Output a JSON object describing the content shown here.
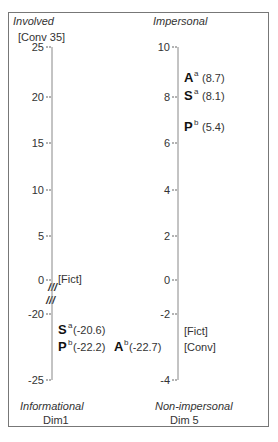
{
  "chart_data": [
    {
      "type": "scatter",
      "name": "Dim1",
      "title": "Dim1",
      "top_label": "Involved",
      "bottom_label": "Informational",
      "top_annotation": "[Conv 35]",
      "axis_break_marks": [
        "///",
        "///"
      ],
      "ticks": [
        {
          "value": 25,
          "label": "25"
        },
        {
          "value": 20,
          "label": "20"
        },
        {
          "value": 15,
          "label": "15"
        },
        {
          "value": 10,
          "label": "10"
        },
        {
          "value": 5,
          "label": "5"
        },
        {
          "value": 0,
          "label": "0"
        },
        {
          "value": -20,
          "label": "-20"
        },
        {
          "value": -25,
          "label": "-25"
        }
      ],
      "points": [
        {
          "label": "[Fict]",
          "value": 0,
          "style": "bracket"
        },
        {
          "letter": "S",
          "sup": "a",
          "value": -20.6,
          "text": "(-20.6)"
        },
        {
          "letter": "P",
          "sup": "b",
          "value": -22.2,
          "text": "(-22.2)"
        },
        {
          "letter": "A",
          "sup": "b",
          "value": -22.7,
          "text": "(-22.7)"
        }
      ]
    },
    {
      "type": "scatter",
      "name": "Dim 5",
      "title": "Dim 5",
      "top_label": "Impersonal",
      "bottom_label": "Non-impersonal",
      "ticks": [
        {
          "value": 10,
          "label": "10"
        },
        {
          "value": 8,
          "label": "8"
        },
        {
          "value": 6,
          "label": "6"
        },
        {
          "value": 4,
          "label": "4"
        },
        {
          "value": 2,
          "label": "2"
        },
        {
          "value": 0,
          "label": "0"
        },
        {
          "value": -2,
          "label": "-2"
        },
        {
          "value": -4,
          "label": "-4"
        }
      ],
      "points": [
        {
          "letter": "A",
          "sup": "a",
          "value": 8.7,
          "text": "(8.7)"
        },
        {
          "letter": "S",
          "sup": "a",
          "value": 8.1,
          "text": "(8.1)"
        },
        {
          "letter": "P",
          "sup": "b",
          "value": 5.4,
          "text": "(5.4)"
        },
        {
          "label": "[Fict]",
          "value": -2.6,
          "style": "bracket"
        },
        {
          "label": "[Conv]",
          "value": -3.0,
          "style": "bracket"
        }
      ]
    }
  ]
}
